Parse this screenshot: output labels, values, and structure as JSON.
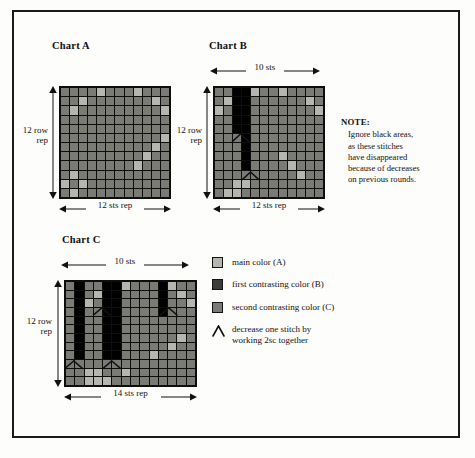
{
  "document": {
    "type": "crochet-colorwork-chart-diagram",
    "colors": {
      "main_A": "#b6b6b0",
      "first_contrasting_B": "#3c3c3c",
      "second_contrasting_C": "#7b7b76",
      "black_area": "#000000",
      "grid_line": "#0d0d0d",
      "page_background": "#fdfdfc",
      "frame_border": "#1a1a1a",
      "text": "#111111"
    }
  },
  "charts": [
    {
      "id": "chart-a",
      "title": "Chart A",
      "top_label": "",
      "left_label": "12 row\nrep",
      "left_label_line1": "12 row",
      "left_label_line2": "rep",
      "bottom_label": "12 sts rep",
      "columns": 12,
      "rows": 12,
      "chart_data": {
        "type": "heatmap",
        "title": "Chart A",
        "xlabel": "12 sts rep",
        "ylabel": "12 row rep",
        "legend": [
          "main color (A)",
          "first contrasting color (B)",
          "second contrasting color (C)"
        ],
        "value_map": {
          "A": "main color (A)",
          "B": "first contrasting color (B)",
          "C": "second contrasting color (C)",
          "K": "black area"
        },
        "grid": [
          [
            "C",
            "C",
            "C",
            "C",
            "A",
            "C",
            "C",
            "C",
            "A",
            "C",
            "C",
            "C"
          ],
          [
            "C",
            "C",
            "A",
            "C",
            "C",
            "C",
            "C",
            "C",
            "C",
            "C",
            "A",
            "C"
          ],
          [
            "C",
            "A",
            "C",
            "C",
            "C",
            "C",
            "C",
            "C",
            "C",
            "C",
            "C",
            "A"
          ],
          [
            "C",
            "C",
            "C",
            "C",
            "C",
            "C",
            "C",
            "C",
            "C",
            "C",
            "C",
            "C"
          ],
          [
            "C",
            "C",
            "C",
            "C",
            "C",
            "C",
            "C",
            "C",
            "C",
            "C",
            "C",
            "C"
          ],
          [
            "C",
            "C",
            "C",
            "C",
            "C",
            "C",
            "C",
            "C",
            "C",
            "C",
            "C",
            "A"
          ],
          [
            "C",
            "C",
            "C",
            "C",
            "C",
            "C",
            "C",
            "C",
            "C",
            "C",
            "A",
            "C"
          ],
          [
            "C",
            "C",
            "C",
            "C",
            "C",
            "C",
            "C",
            "C",
            "C",
            "A",
            "C",
            "C"
          ],
          [
            "C",
            "C",
            "C",
            "C",
            "C",
            "C",
            "C",
            "C",
            "A",
            "C",
            "C",
            "C"
          ],
          [
            "C",
            "A",
            "C",
            "C",
            "C",
            "C",
            "C",
            "C",
            "C",
            "C",
            "C",
            "C"
          ],
          [
            "A",
            "C",
            "A",
            "C",
            "C",
            "C",
            "C",
            "C",
            "C",
            "C",
            "C",
            "C"
          ],
          [
            "C",
            "A",
            "C",
            "C",
            "C",
            "C",
            "C",
            "C",
            "C",
            "C",
            "C",
            "C"
          ]
        ]
      }
    },
    {
      "id": "chart-b",
      "title": "Chart B",
      "top_label": "10 sts",
      "left_label_line1": "12 row",
      "left_label_line2": "rep",
      "bottom_label": "12 sts rep",
      "columns": 12,
      "rows": 12,
      "chart_data": {
        "type": "heatmap",
        "title": "Chart B",
        "xlabel": "12 sts rep",
        "ylabel": "12 row rep",
        "top_axis": "10 sts",
        "legend": [
          "main color (A)",
          "first contrasting color (B)",
          "second contrasting color (C)"
        ],
        "value_map": {
          "A": "main color (A)",
          "B": "first contrasting color (B)",
          "C": "second contrasting color (C)",
          "K": "black area"
        },
        "grid": [
          [
            "C",
            "C",
            "K",
            "K",
            "A",
            "C",
            "C",
            "A",
            "C",
            "C",
            "C",
            "C"
          ],
          [
            "C",
            "A",
            "K",
            "K",
            "C",
            "C",
            "C",
            "C",
            "C",
            "C",
            "A",
            "C"
          ],
          [
            "A",
            "C",
            "K",
            "K",
            "C",
            "C",
            "C",
            "C",
            "C",
            "C",
            "C",
            "A"
          ],
          [
            "C",
            "C",
            "K",
            "K",
            "C",
            "C",
            "C",
            "C",
            "C",
            "C",
            "C",
            "C"
          ],
          [
            "C",
            "C",
            "K",
            "K",
            "C",
            "C",
            "C",
            "C",
            "C",
            "C",
            "C",
            "C"
          ],
          [
            "C",
            "C",
            "C",
            "K",
            "C",
            "C",
            "C",
            "C",
            "C",
            "C",
            "C",
            "C"
          ],
          [
            "C",
            "C",
            "C",
            "K",
            "C",
            "C",
            "C",
            "C",
            "C",
            "C",
            "C",
            "C"
          ],
          [
            "C",
            "C",
            "C",
            "K",
            "C",
            "C",
            "C",
            "A",
            "C",
            "C",
            "C",
            "C"
          ],
          [
            "C",
            "C",
            "C",
            "K",
            "C",
            "C",
            "C",
            "C",
            "A",
            "C",
            "C",
            "C"
          ],
          [
            "C",
            "C",
            "C",
            "C",
            "C",
            "C",
            "C",
            "C",
            "C",
            "A",
            "C",
            "C"
          ],
          [
            "C",
            "C",
            "A",
            "A",
            "C",
            "C",
            "C",
            "C",
            "C",
            "C",
            "C",
            "C"
          ],
          [
            "C",
            "A",
            "A",
            "C",
            "C",
            "C",
            "C",
            "C",
            "C",
            "C",
            "C",
            "C"
          ]
        ],
        "decreases": [
          {
            "row": 5,
            "col": 2
          },
          {
            "row": 9,
            "col": 3
          }
        ]
      }
    },
    {
      "id": "chart-c",
      "title": "Chart C",
      "top_label": "10 sts",
      "left_label_line1": "12 row",
      "left_label_line2": "rep",
      "bottom_label": "14 sts rep",
      "columns": 14,
      "rows": 12,
      "chart_data": {
        "type": "heatmap",
        "title": "Chart C",
        "xlabel": "14 sts rep",
        "ylabel": "12 row rep",
        "top_axis": "10 sts",
        "legend": [
          "main color (A)",
          "first contrasting color (B)",
          "second contrasting color (C)"
        ],
        "value_map": {
          "A": "main color (A)",
          "B": "first contrasting color (B)",
          "C": "second contrasting color (C)",
          "K": "black area"
        },
        "grid": [
          [
            "C",
            "K",
            "C",
            "C",
            "K",
            "K",
            "A",
            "C",
            "C",
            "C",
            "K",
            "A",
            "C",
            "C"
          ],
          [
            "C",
            "K",
            "C",
            "A",
            "K",
            "K",
            "C",
            "C",
            "C",
            "C",
            "K",
            "C",
            "A",
            "C"
          ],
          [
            "C",
            "K",
            "A",
            "C",
            "K",
            "K",
            "C",
            "C",
            "C",
            "C",
            "K",
            "C",
            "C",
            "A"
          ],
          [
            "C",
            "K",
            "C",
            "C",
            "K",
            "K",
            "C",
            "C",
            "C",
            "C",
            "K",
            "C",
            "C",
            "C"
          ],
          [
            "C",
            "K",
            "C",
            "C",
            "K",
            "K",
            "C",
            "C",
            "C",
            "C",
            "C",
            "C",
            "C",
            "C"
          ],
          [
            "C",
            "K",
            "C",
            "C",
            "K",
            "K",
            "C",
            "C",
            "C",
            "C",
            "C",
            "C",
            "C",
            "C"
          ],
          [
            "C",
            "K",
            "C",
            "C",
            "K",
            "K",
            "C",
            "C",
            "C",
            "C",
            "C",
            "C",
            "A",
            "C"
          ],
          [
            "C",
            "K",
            "C",
            "C",
            "K",
            "K",
            "C",
            "C",
            "C",
            "C",
            "C",
            "A",
            "C",
            "C"
          ],
          [
            "C",
            "K",
            "C",
            "C",
            "K",
            "K",
            "C",
            "C",
            "C",
            "A",
            "C",
            "C",
            "C",
            "C"
          ],
          [
            "C",
            "C",
            "C",
            "C",
            "C",
            "C",
            "C",
            "C",
            "C",
            "C",
            "C",
            "C",
            "C",
            "C"
          ],
          [
            "C",
            "C",
            "A",
            "A",
            "C",
            "C",
            "A",
            "C",
            "C",
            "C",
            "C",
            "C",
            "C",
            "C"
          ],
          [
            "C",
            "C",
            "A",
            "A",
            "A",
            "C",
            "C",
            "C",
            "C",
            "C",
            "C",
            "C",
            "C",
            "C"
          ]
        ],
        "decreases": [
          {
            "row": 3,
            "col": 3
          },
          {
            "row": 3,
            "col": 10
          },
          {
            "row": 9,
            "col": 0
          },
          {
            "row": 9,
            "col": 4
          }
        ]
      }
    }
  ],
  "note": {
    "heading": "NOTE:",
    "lines": [
      "Ignore black areas,",
      "as these stitches",
      "have disappeared",
      "because of decreases",
      "on previous rounds."
    ]
  },
  "legend": {
    "items": [
      {
        "icon": "swatch-light",
        "label": "main color (A)",
        "color": "#b6b6b0"
      },
      {
        "icon": "swatch-dark",
        "label": "first contrasting color (B)",
        "color": "#3c3c3c"
      },
      {
        "icon": "swatch-medium",
        "label": "second contrasting color (C)",
        "color": "#7b7b76"
      },
      {
        "icon": "chevron-decrease-icon",
        "label_line1": "decrease one stitch by",
        "label_line2": "working 2sc together",
        "color": "#111111"
      }
    ]
  }
}
